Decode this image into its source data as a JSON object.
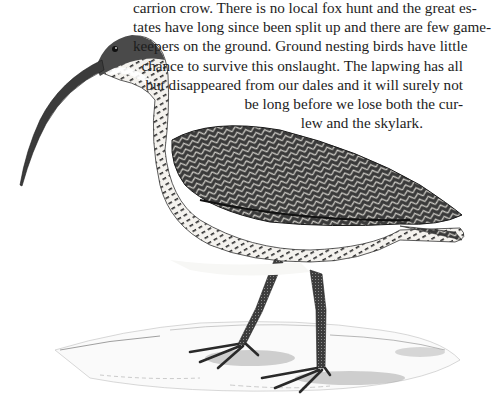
{
  "document": {
    "type": "book-page",
    "paragraph": {
      "lines": [
        "carrion crow. There is no local fox hunt and the great es-",
        "tates have long since been split up and there are few game-",
        "keepers on the ground. Ground nesting birds have little",
        "chance to survive this onslaught. The lapwing has all",
        "but disappeared from our dales and it will surely not",
        "be long before we lose both the cur-",
        "lew and the skylark."
      ]
    },
    "illustration": {
      "subject": "curlew-engraving",
      "description": "Engraved illustration of a curlew with long down-curved bill standing on sandy ground",
      "colors": {
        "ink": "#1a1a1a",
        "paper": "#ffffff",
        "shadow": "#8a8a8a"
      }
    }
  }
}
